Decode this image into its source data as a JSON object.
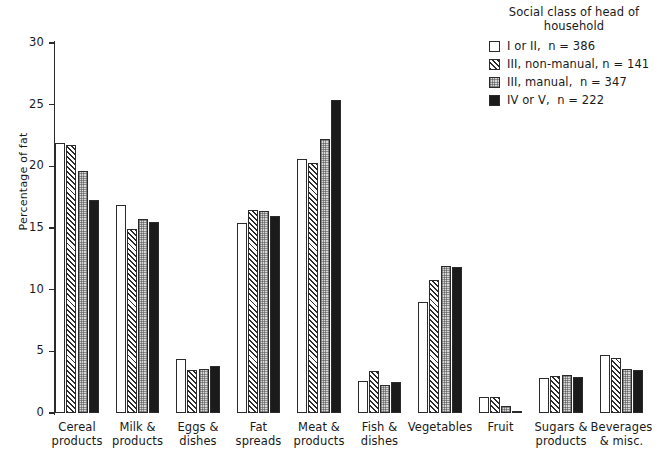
{
  "chart_data": {
    "type": "bar",
    "title": "",
    "xlabel": "",
    "ylabel": "Percentage of fat",
    "ylim": [
      0,
      30
    ],
    "yticks": [
      0,
      5,
      10,
      15,
      20,
      25,
      30
    ],
    "grid": false,
    "legend_position": "top-right",
    "legend_title": "Social class of head of\nhousehold",
    "categories": [
      "Cereal\nproducts",
      "Milk &\nproducts",
      "Eggs &\ndishes",
      "Fat\nspreads",
      "Meat &\nproducts",
      "Fish &\ndishes",
      "Vegetables",
      "Fruit",
      "Sugars &\nproducts",
      "Beverages\n& misc."
    ],
    "series": [
      {
        "name": "I or II,  n = 386",
        "fill": "white",
        "values": [
          21.9,
          16.9,
          4.4,
          15.4,
          20.6,
          2.6,
          9.0,
          1.3,
          2.8,
          4.7
        ]
      },
      {
        "name": "III, non-manual, n = 141",
        "fill": "diagonal-hatch",
        "values": [
          21.7,
          14.9,
          3.5,
          16.5,
          20.3,
          3.4,
          10.8,
          1.3,
          3.0,
          4.5
        ]
      },
      {
        "name": "III, manual,  n = 347",
        "fill": "cross-hatch-gray",
        "values": [
          19.6,
          15.7,
          3.6,
          16.4,
          22.2,
          2.3,
          11.9,
          0.6,
          3.1,
          3.6
        ]
      },
      {
        "name": "IV or V,  n = 222",
        "fill": "solid-black",
        "values": [
          17.3,
          15.5,
          3.8,
          16.0,
          25.4,
          2.5,
          11.8,
          0.2,
          2.9,
          3.5
        ]
      }
    ]
  },
  "legend": {
    "title": "Social class of head of\nhousehold",
    "items": [
      {
        "label": "I or II,  n = 386",
        "swatch": "white"
      },
      {
        "label": "III, non-manual, n = 141",
        "swatch": "diagonal-hatch"
      },
      {
        "label": "III, manual,  n = 347",
        "swatch": "cross-hatch-gray"
      },
      {
        "label": "IV or V,  n = 222",
        "swatch": "solid-black"
      }
    ]
  },
  "axis": {
    "y_title": "Percentage of fat",
    "y_tick_labels": [
      "30",
      "25",
      "20",
      "15",
      "10",
      "5",
      "0"
    ]
  },
  "colors": {
    "axis": "#2b2b2b",
    "bar_white": "#ffffff",
    "bar_gray": "#d8d8d8",
    "bar_black": "#1b1b1b",
    "text": "#1a1a1a",
    "background": "#ffffff"
  }
}
